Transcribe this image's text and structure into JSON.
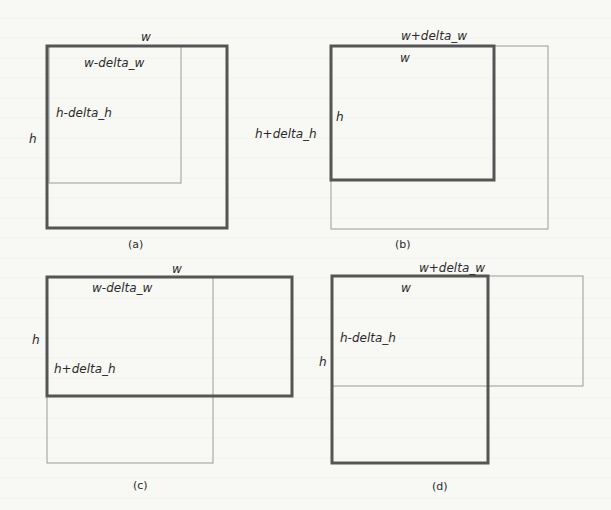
{
  "figure": {
    "stroke_colors": {
      "thick": "#555555",
      "thin": "#9a9a9a"
    },
    "panels": [
      {
        "caption": "(a)",
        "thick_box": {
          "x": 47,
          "y": 46,
          "w": 180,
          "h": 182
        },
        "thin_box": {
          "x": 49,
          "y": 46,
          "w": 132,
          "h": 137
        },
        "labels": {
          "top": "w",
          "inner_top": "w-delta_w",
          "inner_side": "h-delta_h",
          "side": "h"
        }
      },
      {
        "caption": "(b)",
        "thick_box": {
          "x": 331,
          "y": 46,
          "w": 163,
          "h": 134
        },
        "thin_box": {
          "x": 331,
          "y": 46,
          "w": 217,
          "h": 183
        },
        "labels": {
          "top": "w+delta_w",
          "inner_top": "w",
          "inner_side": "h",
          "side": "h+delta_h"
        }
      },
      {
        "caption": "(c)",
        "thick_box": {
          "x": 47,
          "y": 277,
          "w": 245,
          "h": 119
        },
        "thin_box": {
          "x": 47,
          "y": 277,
          "w": 166,
          "h": 186
        },
        "labels": {
          "top": "w",
          "inner_top": "w-delta_w",
          "inner_side": "h+delta_h",
          "side": "h"
        }
      },
      {
        "caption": "(d)",
        "thick_box": {
          "x": 332,
          "y": 276,
          "w": 156,
          "h": 187
        },
        "thin_box": {
          "x": 332,
          "y": 276,
          "w": 251,
          "h": 110
        },
        "labels": {
          "top": "w+delta_w",
          "inner_top": "w",
          "inner_side": "h-delta_h",
          "side": "h"
        }
      }
    ]
  }
}
